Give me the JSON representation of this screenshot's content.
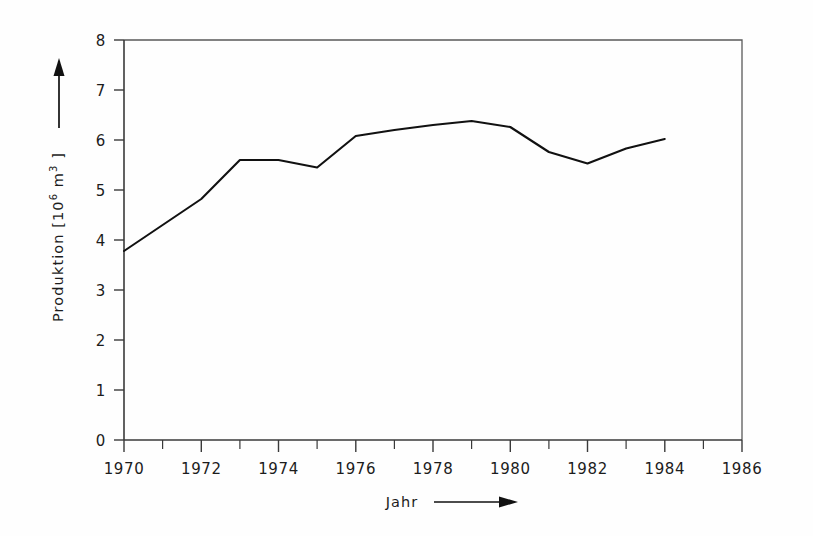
{
  "chart_data": {
    "type": "line",
    "title": "",
    "subtitle": "",
    "xlabel": "Jahr",
    "ylabel": "Produktion [10⁶ m³]",
    "ylabel_parts": {
      "prefix": "Produktion [10",
      "exponent": "6",
      "suffix": " m",
      "unit_exponent": "3",
      "close": " ]"
    },
    "x": [
      1970,
      1971,
      1972,
      1973,
      1974,
      1975,
      1976,
      1977,
      1978,
      1979,
      1980,
      1981,
      1982,
      1983,
      1984
    ],
    "values": [
      3.78,
      4.3,
      4.82,
      5.6,
      5.6,
      5.45,
      6.08,
      6.2,
      6.3,
      6.38,
      6.26,
      5.76,
      5.53,
      5.83,
      6.02
    ],
    "series": [
      {
        "name": "Produktion",
        "values": [
          3.78,
          4.3,
          4.82,
          5.6,
          5.6,
          5.45,
          6.08,
          6.2,
          6.3,
          6.38,
          6.26,
          5.76,
          5.53,
          5.83,
          6.02
        ]
      }
    ],
    "xlim": [
      1970,
      1986
    ],
    "ylim": [
      0,
      8
    ],
    "xtick_labels": [
      "1970",
      "1972",
      "1974",
      "1976",
      "1978",
      "1980",
      "1982",
      "1984",
      "1986"
    ],
    "xtick_values": [
      1970,
      1972,
      1974,
      1976,
      1978,
      1980,
      1982,
      1984,
      1986
    ],
    "xtick_minor_step": 1,
    "ytick_labels": [
      "0",
      "1",
      "2",
      "3",
      "4",
      "5",
      "6",
      "7",
      "8"
    ],
    "ytick_values": [
      0,
      1,
      2,
      3,
      4,
      5,
      6,
      7,
      8
    ],
    "grid": false,
    "legend": false,
    "legend_position": "none",
    "line_color": "#111111",
    "axis_color": "#3a3a3a",
    "background_color": "#fefefe",
    "annotations": [
      {
        "name": "y-axis-arrow",
        "text": "",
        "direction": "up"
      },
      {
        "name": "x-axis-arrow",
        "text": "",
        "direction": "right"
      }
    ]
  }
}
